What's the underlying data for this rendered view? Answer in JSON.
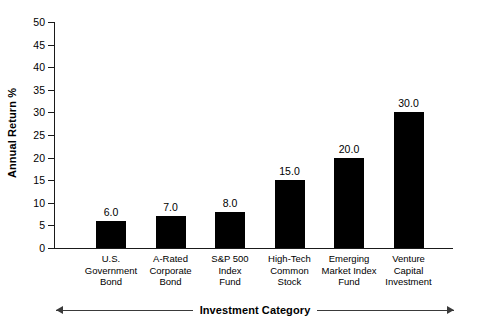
{
  "chart_data": {
    "type": "bar",
    "title": "",
    "subtitle": "",
    "xlabel": "Investment Category",
    "ylabel": "Annual Return %",
    "categories": [
      "U.S.\nGovernment\nBond",
      "A-Rated\nCorporate\nBond",
      "S&P 500\nIndex\nFund",
      "High-Tech\nCommon\nStock",
      "Emerging\nMarket Index\nFund",
      "Venture\nCapital\nInvestment"
    ],
    "values": [
      6.0,
      7.0,
      8.0,
      15.0,
      20.0,
      30.0
    ],
    "value_labels": [
      "6.0",
      "7.0",
      "8.0",
      "15.0",
      "20.0",
      "30.0"
    ],
    "ylim": [
      0,
      50
    ],
    "ytick_step": 5,
    "yticks": [
      0,
      5,
      10,
      15,
      20,
      25,
      30,
      35,
      40,
      45,
      50
    ],
    "ytick_labels": [
      "0",
      "5",
      "10",
      "15",
      "20",
      "25",
      "30",
      "35",
      "40",
      "45",
      "50"
    ],
    "grid": false,
    "legend": false,
    "bar_color": "#000000",
    "axis_color": "#1a1a1a",
    "background": "#ffffff"
  }
}
